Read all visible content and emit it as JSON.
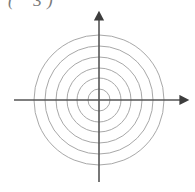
{
  "canvas": {
    "width": 195,
    "height": 192,
    "background": "#ffffff"
  },
  "figure_label": {
    "text": "(    3 )",
    "note_clipped": "top of text cropped by image edge",
    "color": "#7a7a7a"
  },
  "chart_data": {
    "type": "polar-grid",
    "title": "",
    "subtitle": "",
    "xlabel": "",
    "ylabel": "",
    "grid": true,
    "legend": null,
    "origin": {
      "x": 99,
      "y": 100
    },
    "circle_count": 6,
    "circle_radii_px": [
      11,
      22,
      32,
      43,
      54,
      65
    ],
    "circle_color": "#a8a8a8",
    "circle_stroke_width": 1,
    "axes": {
      "color": "#555555",
      "stroke_width": 2,
      "horizontal": {
        "name": "x-axis",
        "x_start": 14,
        "x_end": 188,
        "y": 100,
        "arrow_right": true,
        "arrow_left": false
      },
      "vertical": {
        "name": "y-axis",
        "x": 99,
        "y_start": 12,
        "y_end": 182,
        "arrow_top": true,
        "arrow_bottom": false
      }
    },
    "tick_labels": [],
    "annotations": [],
    "data_points": []
  }
}
